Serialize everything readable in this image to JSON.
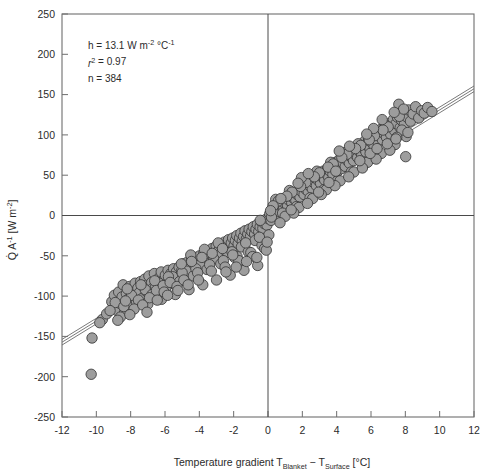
{
  "chart_data": {
    "type": "scatter",
    "title": "",
    "xlabel": "Temperature gradient T_Blanket − T_Surface [°C]",
    "xlabel_parts": {
      "prefix": "Temperature gradient T",
      "sub1": "Blanket",
      "middle": " − T",
      "sub2": "Surface",
      "suffix": " [°C]"
    },
    "ylabel": "Q̇ A⁻¹ [W m⁻²]",
    "ylabel_parts": {
      "q": "Q",
      "a": "A",
      "a_sup": "-1",
      "unit_open": " [W m",
      "unit_sup": "-2",
      "unit_close": "]"
    },
    "xlim": [
      -12,
      12
    ],
    "ylim": [
      -250,
      250
    ],
    "xticks": [
      -12,
      -10,
      -8,
      -6,
      -4,
      -2,
      0,
      2,
      4,
      6,
      8,
      10,
      12
    ],
    "yticks": [
      250,
      200,
      150,
      100,
      50,
      0,
      -50,
      -100,
      -150,
      -200,
      -250
    ],
    "xtick_labels": [
      "-12",
      "-10",
      "-8",
      "-6",
      "-4",
      "-2",
      "0",
      "2",
      "4",
      "6",
      "8",
      "10",
      "12"
    ],
    "ytick_labels": [
      "250",
      "200",
      "150",
      "100",
      "50",
      "0",
      "-50",
      "-100",
      "-150",
      "-200",
      "-250"
    ],
    "grid": false,
    "legend": "none",
    "zero_lines": {
      "x": 0,
      "y": 0
    },
    "annotations": {
      "slope_line": {
        "prefix": "h = 13.1 W m",
        "sup1": "-2",
        "mid": " °C",
        "sup2": "-1"
      },
      "r2_line": {
        "r": "r",
        "sup": "2",
        "value": " = 0.97"
      },
      "n_line": "n = 384"
    },
    "fit": {
      "label": "linear regression with confidence band",
      "slope": 13.1,
      "intercept": 0.0,
      "band_offset": 3.5,
      "n_lines": 3
    },
    "marker": {
      "shape": "circle",
      "fill_color": "#9d9d9d",
      "edge_color": "#3a3a3a",
      "radius_px": 5.2
    },
    "colors": {
      "frame": "#6e6e6e",
      "zero_line": "#4a4a4a",
      "text": "#2b2b2b",
      "background": "#ffffff"
    },
    "n_points": 384,
    "points": [
      [
        -10.3,
        -197.0
      ],
      [
        -10.25,
        -152.0
      ],
      [
        -9.65,
        -129.0
      ],
      [
        -9.1,
        -107.0
      ],
      [
        -8.95,
        -99.0
      ],
      [
        -8.8,
        -118.0
      ],
      [
        -8.7,
        -95.0
      ],
      [
        -8.62,
        -109.0
      ],
      [
        -8.5,
        -101.0
      ],
      [
        -8.44,
        -86.0
      ],
      [
        -8.35,
        -120.0
      ],
      [
        -8.25,
        -97.0
      ],
      [
        -8.15,
        -104.0
      ],
      [
        -8.05,
        -88.0
      ],
      [
        -7.98,
        -112.0
      ],
      [
        -7.9,
        -93.0
      ],
      [
        -7.82,
        -100.0
      ],
      [
        -7.74,
        -84.0
      ],
      [
        -7.66,
        -107.0
      ],
      [
        -7.58,
        -90.0
      ],
      [
        -7.5,
        -96.0
      ],
      [
        -7.42,
        -82.0
      ],
      [
        -7.34,
        -103.0
      ],
      [
        -7.26,
        -88.0
      ],
      [
        -7.18,
        -79.0
      ],
      [
        -7.1,
        -94.0
      ],
      [
        -7.02,
        -86.0
      ],
      [
        -6.94,
        -75.0
      ],
      [
        -6.86,
        -99.0
      ],
      [
        -6.78,
        -83.0
      ],
      [
        -6.7,
        -90.0
      ],
      [
        -6.62,
        -72.0
      ],
      [
        -6.54,
        -88.0
      ],
      [
        -6.46,
        -95.0
      ],
      [
        -6.38,
        -78.0
      ],
      [
        -6.3,
        -85.0
      ],
      [
        -6.22,
        -70.0
      ],
      [
        -6.14,
        -92.0
      ],
      [
        -6.06,
        -80.0
      ],
      [
        -5.98,
        -74.0
      ],
      [
        -5.9,
        -87.0
      ],
      [
        -5.82,
        -68.0
      ],
      [
        -5.74,
        -79.0
      ],
      [
        -5.66,
        -72.0
      ],
      [
        -5.58,
        -84.0
      ],
      [
        -5.5,
        -66.0
      ],
      [
        -5.42,
        -77.0
      ],
      [
        -5.34,
        -70.0
      ],
      [
        -5.26,
        -81.0
      ],
      [
        -5.18,
        -64.0
      ],
      [
        -5.1,
        -74.0
      ],
      [
        -5.02,
        -68.0
      ],
      [
        -4.94,
        -60.0
      ],
      [
        -4.86,
        -76.0
      ],
      [
        -4.78,
        -66.0
      ],
      [
        -4.7,
        -58.0
      ],
      [
        -4.62,
        -71.0
      ],
      [
        -4.54,
        -62.0
      ],
      [
        -4.46,
        -55.0
      ],
      [
        -4.38,
        -68.0
      ],
      [
        -4.3,
        -59.0
      ],
      [
        -4.22,
        -52.0
      ],
      [
        -4.14,
        -65.0
      ],
      [
        -4.06,
        -57.0
      ],
      [
        -3.98,
        -50.0
      ],
      [
        -3.9,
        -62.0
      ],
      [
        -3.82,
        -54.0
      ],
      [
        -3.74,
        -47.0
      ],
      [
        -3.66,
        -59.0
      ],
      [
        -3.58,
        -51.0
      ],
      [
        -3.5,
        -44.0
      ],
      [
        -3.42,
        -56.0
      ],
      [
        -3.34,
        -48.0
      ],
      [
        -3.26,
        -41.0
      ],
      [
        -3.18,
        -53.0
      ],
      [
        -3.1,
        -45.0
      ],
      [
        -3.02,
        -38.0
      ],
      [
        -2.94,
        -50.0
      ],
      [
        -2.86,
        -43.0
      ],
      [
        -2.78,
        -36.0
      ],
      [
        -2.7,
        -47.0
      ],
      [
        -2.62,
        -40.0
      ],
      [
        -2.54,
        -33.0
      ],
      [
        -2.46,
        -44.0
      ],
      [
        -2.38,
        -37.0
      ],
      [
        -2.3,
        -30.0
      ],
      [
        -2.22,
        -41.0
      ],
      [
        -2.14,
        -34.0
      ],
      [
        -2.06,
        -28.0
      ],
      [
        -1.98,
        -38.0
      ],
      [
        -1.9,
        -31.0
      ],
      [
        -1.82,
        -25.0
      ],
      [
        -1.74,
        -35.0
      ],
      [
        -1.66,
        -28.0
      ],
      [
        -1.58,
        -22.0
      ],
      [
        -1.5,
        -32.0
      ],
      [
        -1.42,
        -26.0
      ],
      [
        -1.34,
        -19.0
      ],
      [
        -1.26,
        -29.0
      ],
      [
        -1.18,
        -23.0
      ],
      [
        -1.1,
        -17.0
      ],
      [
        -1.02,
        -26.0
      ],
      [
        -0.94,
        -20.0
      ],
      [
        -0.86,
        -14.0
      ],
      [
        -0.78,
        -23.0
      ],
      [
        -0.7,
        -17.0
      ],
      [
        -0.62,
        -11.0
      ],
      [
        -0.54,
        -20.0
      ],
      [
        -0.46,
        -14.0
      ],
      [
        -0.38,
        -8.0
      ],
      [
        -0.3,
        -16.0
      ],
      [
        -0.22,
        -10.0
      ],
      [
        -0.14,
        -5.0
      ],
      [
        -0.06,
        -12.0
      ],
      [
        0.02,
        -4.0
      ],
      [
        0.1,
        2.0
      ],
      [
        0.18,
        -6.0
      ],
      [
        0.26,
        4.0
      ],
      [
        0.34,
        9.0
      ],
      [
        0.42,
        1.0
      ],
      [
        0.5,
        8.0
      ],
      [
        0.58,
        13.0
      ],
      [
        0.66,
        5.0
      ],
      [
        0.74,
        12.0
      ],
      [
        0.82,
        17.0
      ],
      [
        0.9,
        8.0
      ],
      [
        0.98,
        15.0
      ],
      [
        1.06,
        21.0
      ],
      [
        1.14,
        12.0
      ],
      [
        1.22,
        19.0
      ],
      [
        1.3,
        25.0
      ],
      [
        1.38,
        16.0
      ],
      [
        1.46,
        22.0
      ],
      [
        1.54,
        28.0
      ],
      [
        1.62,
        19.0
      ],
      [
        1.7,
        26.0
      ],
      [
        1.78,
        32.0
      ],
      [
        1.86,
        23.0
      ],
      [
        1.94,
        30.0
      ],
      [
        2.02,
        36.0
      ],
      [
        2.1,
        26.0
      ],
      [
        2.18,
        33.0
      ],
      [
        2.26,
        40.0
      ],
      [
        2.34,
        30.0
      ],
      [
        2.42,
        37.0
      ],
      [
        2.5,
        43.0
      ],
      [
        2.58,
        33.0
      ],
      [
        2.66,
        41.0
      ],
      [
        2.74,
        47.0
      ],
      [
        2.82,
        37.0
      ],
      [
        2.9,
        44.0
      ],
      [
        2.98,
        51.0
      ],
      [
        3.06,
        40.0
      ],
      [
        3.14,
        48.0
      ],
      [
        3.22,
        55.0
      ],
      [
        3.3,
        44.0
      ],
      [
        3.38,
        52.0
      ],
      [
        3.46,
        58.0
      ],
      [
        3.54,
        47.0
      ],
      [
        3.62,
        55.0
      ],
      [
        3.7,
        62.0
      ],
      [
        3.78,
        51.0
      ],
      [
        3.86,
        59.0
      ],
      [
        3.94,
        66.0
      ],
      [
        4.02,
        54.0
      ],
      [
        4.1,
        62.0
      ],
      [
        4.18,
        70.0
      ],
      [
        4.26,
        58.0
      ],
      [
        4.34,
        66.0
      ],
      [
        4.42,
        73.0
      ],
      [
        4.5,
        61.0
      ],
      [
        4.58,
        69.0
      ],
      [
        4.66,
        77.0
      ],
      [
        4.74,
        65.0
      ],
      [
        4.82,
        73.0
      ],
      [
        4.9,
        81.0
      ],
      [
        4.98,
        68.0
      ],
      [
        5.06,
        76.0
      ],
      [
        5.14,
        84.0
      ],
      [
        5.22,
        72.0
      ],
      [
        5.3,
        80.0
      ],
      [
        5.38,
        88.0
      ],
      [
        5.46,
        75.0
      ],
      [
        5.54,
        84.0
      ],
      [
        5.62,
        92.0
      ],
      [
        5.7,
        79.0
      ],
      [
        5.78,
        87.0
      ],
      [
        5.86,
        95.0
      ],
      [
        5.94,
        83.0
      ],
      [
        6.02,
        91.0
      ],
      [
        6.1,
        99.0
      ],
      [
        6.18,
        86.0
      ],
      [
        6.26,
        95.0
      ],
      [
        6.34,
        103.0
      ],
      [
        6.42,
        90.0
      ],
      [
        6.5,
        98.0
      ],
      [
        6.58,
        107.0
      ],
      [
        6.66,
        94.0
      ],
      [
        6.74,
        102.0
      ],
      [
        6.82,
        111.0
      ],
      [
        6.9,
        97.0
      ],
      [
        6.98,
        106.0
      ],
      [
        7.06,
        114.0
      ],
      [
        7.14,
        101.0
      ],
      [
        7.22,
        110.0
      ],
      [
        7.3,
        119.0
      ],
      [
        7.38,
        105.0
      ],
      [
        7.46,
        114.0
      ],
      [
        7.54,
        122.0
      ],
      [
        7.62,
        138.0
      ],
      [
        7.7,
        109.0
      ],
      [
        7.78,
        118.0
      ],
      [
        7.86,
        127.0
      ],
      [
        7.94,
        113.0
      ],
      [
        8.02,
        73.0
      ],
      [
        8.1,
        122.0
      ],
      [
        8.18,
        131.0
      ],
      [
        8.3,
        117.0
      ],
      [
        8.45,
        126.0
      ],
      [
        8.6,
        135.0
      ],
      [
        8.78,
        121.0
      ],
      [
        8.95,
        130.0
      ],
      [
        9.1,
        127.0
      ],
      [
        9.3,
        134.0
      ],
      [
        9.55,
        129.0
      ],
      [
        -8.9,
        -108.0
      ],
      [
        -8.4,
        -113.0
      ],
      [
        -7.95,
        -99.0
      ],
      [
        -7.55,
        -105.0
      ],
      [
        -7.15,
        -92.0
      ],
      [
        -6.75,
        -98.0
      ],
      [
        -6.35,
        -84.0
      ],
      [
        -5.95,
        -90.0
      ],
      [
        -5.55,
        -76.0
      ],
      [
        -5.15,
        -82.0
      ],
      [
        -4.75,
        -69.0
      ],
      [
        -4.35,
        -75.0
      ],
      [
        -3.95,
        -61.0
      ],
      [
        -3.55,
        -67.0
      ],
      [
        -3.15,
        -54.0
      ],
      [
        -2.75,
        -60.0
      ],
      [
        -2.35,
        -46.0
      ],
      [
        -1.95,
        -52.0
      ],
      [
        -1.55,
        -39.0
      ],
      [
        -1.15,
        -45.0
      ],
      [
        -0.75,
        -31.0
      ],
      [
        -0.35,
        -37.0
      ],
      [
        0.05,
        -24.0
      ],
      [
        0.45,
        20.0
      ],
      [
        0.85,
        3.0
      ],
      [
        1.25,
        31.0
      ],
      [
        1.65,
        11.0
      ],
      [
        2.05,
        44.0
      ],
      [
        2.45,
        22.0
      ],
      [
        2.85,
        55.0
      ],
      [
        3.25,
        32.0
      ],
      [
        3.65,
        66.0
      ],
      [
        4.05,
        43.0
      ],
      [
        4.45,
        78.0
      ],
      [
        4.85,
        54.0
      ],
      [
        5.25,
        89.0
      ],
      [
        5.65,
        65.0
      ],
      [
        6.05,
        100.0
      ],
      [
        6.45,
        76.0
      ],
      [
        6.85,
        112.0
      ],
      [
        7.25,
        87.0
      ],
      [
        7.65,
        123.0
      ],
      [
        8.05,
        98.0
      ],
      [
        -9.4,
        -122.0
      ],
      [
        -8.6,
        -126.0
      ],
      [
        -8.2,
        -91.0
      ],
      [
        -7.8,
        -116.0
      ],
      [
        -7.4,
        -86.0
      ],
      [
        -7.0,
        -110.0
      ],
      [
        -6.6,
        -81.0
      ],
      [
        -6.2,
        -104.0
      ],
      [
        -5.8,
        -76.0
      ],
      [
        -5.4,
        -98.0
      ],
      [
        -5.0,
        -71.0
      ],
      [
        -4.6,
        -92.0
      ],
      [
        -4.2,
        -66.0
      ],
      [
        -3.8,
        -86.0
      ],
      [
        -3.4,
        -61.0
      ],
      [
        -3.0,
        -80.0
      ],
      [
        -2.6,
        -56.0
      ],
      [
        -2.2,
        -74.0
      ],
      [
        -1.8,
        -51.0
      ],
      [
        -1.4,
        -68.0
      ],
      [
        -1.0,
        -46.0
      ],
      [
        -0.6,
        -62.0
      ],
      [
        -0.2,
        -41.0
      ],
      [
        0.2,
        -2.0
      ],
      [
        0.6,
        18.0
      ],
      [
        1.0,
        -1.0
      ],
      [
        1.4,
        29.0
      ],
      [
        1.8,
        10.0
      ],
      [
        2.2,
        41.0
      ],
      [
        2.6,
        21.0
      ],
      [
        3.0,
        53.0
      ],
      [
        3.4,
        32.0
      ],
      [
        3.8,
        64.0
      ],
      [
        4.2,
        43.0
      ],
      [
        4.6,
        76.0
      ],
      [
        5.0,
        54.0
      ],
      [
        5.4,
        87.0
      ],
      [
        5.8,
        66.0
      ],
      [
        6.2,
        99.0
      ],
      [
        6.6,
        77.0
      ],
      [
        7.0,
        110.0
      ],
      [
        7.4,
        88.0
      ],
      [
        7.8,
        106.0
      ],
      [
        -8.05,
        -123.0
      ],
      [
        -7.3,
        -111.0
      ],
      [
        -6.9,
        -102.0
      ],
      [
        -6.5,
        -93.0
      ],
      [
        -6.1,
        -87.0
      ],
      [
        -5.7,
        -83.0
      ],
      [
        -5.3,
        -88.0
      ],
      [
        -4.9,
        -80.0
      ],
      [
        -4.5,
        -49.0
      ],
      [
        -4.1,
        -71.0
      ],
      [
        -3.7,
        -42.0
      ],
      [
        -3.3,
        -69.0
      ],
      [
        -2.9,
        -34.0
      ],
      [
        -2.5,
        -64.0
      ],
      [
        -2.1,
        -45.0
      ],
      [
        -1.7,
        -56.0
      ],
      [
        -1.3,
        -34.0
      ],
      [
        -0.9,
        -51.0
      ],
      [
        -0.5,
        -27.0
      ],
      [
        -0.1,
        -43.0
      ],
      [
        0.3,
        12.0
      ],
      [
        0.7,
        -9.0
      ],
      [
        1.1,
        24.0
      ],
      [
        1.5,
        3.0
      ],
      [
        1.9,
        36.0
      ],
      [
        2.3,
        15.0
      ],
      [
        2.7,
        48.0
      ],
      [
        3.1,
        26.0
      ],
      [
        3.5,
        60.0
      ],
      [
        3.9,
        37.0
      ],
      [
        4.3,
        72.0
      ],
      [
        4.7,
        48.0
      ],
      [
        5.1,
        83.0
      ],
      [
        5.5,
        59.0
      ],
      [
        5.9,
        94.0
      ],
      [
        6.3,
        70.0
      ],
      [
        6.7,
        106.0
      ],
      [
        7.1,
        81.0
      ],
      [
        7.5,
        97.0
      ],
      [
        7.9,
        132.0
      ],
      [
        -9.8,
        -133.0
      ],
      [
        -9.2,
        -118.0
      ],
      [
        -8.75,
        -130.0
      ],
      [
        -8.3,
        -106.0
      ],
      [
        -6.05,
        -95.0
      ],
      [
        -5.05,
        -60.0
      ],
      [
        -4.05,
        -80.0
      ],
      [
        -2.05,
        -49.0
      ],
      [
        -0.05,
        -33.0
      ],
      [
        1.95,
        47.0
      ],
      [
        3.95,
        55.0
      ],
      [
        5.95,
        77.0
      ],
      [
        6.15,
        108.0
      ],
      [
        6.95,
        89.0
      ],
      [
        7.35,
        128.0
      ],
      [
        8.15,
        103.0
      ],
      [
        -7.05,
        -120.0
      ],
      [
        -6.45,
        -105.0
      ],
      [
        -5.85,
        -99.0
      ],
      [
        -5.25,
        -93.0
      ],
      [
        -4.65,
        -86.0
      ],
      [
        -4.45,
        -57.0
      ],
      [
        -3.85,
        -52.0
      ],
      [
        -3.25,
        -47.0
      ],
      [
        -2.65,
        -41.0
      ],
      [
        -2.45,
        -70.0
      ],
      [
        -1.85,
        -64.0
      ],
      [
        -1.25,
        -57.0
      ],
      [
        -0.65,
        -52.0
      ],
      [
        -0.45,
        -6.0
      ],
      [
        0.15,
        6.0
      ],
      [
        0.75,
        21.0
      ],
      [
        1.35,
        7.0
      ],
      [
        1.75,
        40.0
      ],
      [
        2.35,
        52.0
      ],
      [
        2.95,
        29.0
      ],
      [
        3.55,
        41.0
      ],
      [
        4.15,
        80.0
      ],
      [
        4.75,
        86.0
      ],
      [
        5.35,
        68.0
      ],
      [
        5.75,
        101.0
      ],
      [
        6.35,
        83.0
      ],
      [
        6.65,
        119.0
      ],
      [
        7.45,
        95.0
      ]
    ]
  }
}
